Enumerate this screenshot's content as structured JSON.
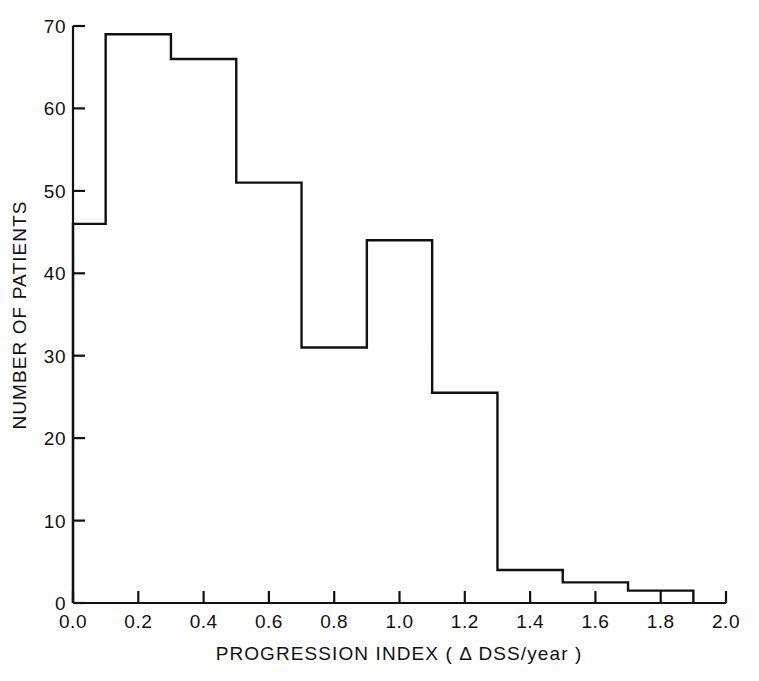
{
  "chart_data": {
    "type": "bar",
    "title": "",
    "subtitle": "",
    "xlabel": "PROGRESSION INDEX ( Δ DSS/year )",
    "ylabel": "NUMBER OF PATIENTS",
    "xlim": [
      0.0,
      2.0
    ],
    "ylim": [
      0,
      70
    ],
    "grid": false,
    "legend": "none",
    "bin_width": 0.2,
    "bin_edges": [
      0.0,
      0.1,
      0.3,
      0.5,
      0.7,
      0.9,
      1.1,
      1.3,
      1.5,
      1.7,
      1.9
    ],
    "categories": [
      "0.0–0.1",
      "0.1–0.3",
      "0.3–0.5",
      "0.5–0.7",
      "0.7–0.9",
      "0.9–1.1",
      "1.1–1.3",
      "1.3–1.5",
      "1.5–1.7",
      "1.7–1.9"
    ],
    "values": [
      46,
      69,
      66,
      51,
      31,
      44,
      25.5,
      4,
      2.5,
      1.5
    ],
    "x_ticks": [
      0.0,
      0.2,
      0.4,
      0.6,
      0.8,
      1.0,
      1.2,
      1.4,
      1.6,
      1.8,
      2.0
    ],
    "x_tick_labels": [
      "0.0",
      "0.2",
      "0.4",
      "0.6",
      "0.8",
      "1.0",
      "1.2",
      "1.4",
      "1.6",
      "1.8",
      "2.0"
    ],
    "y_ticks": [
      0,
      10,
      20,
      30,
      40,
      50,
      60,
      70
    ],
    "y_tick_labels": [
      "0",
      "10",
      "20",
      "30",
      "40",
      "50",
      "60",
      "70"
    ],
    "bar_style": "outline",
    "bar_fill": "#ffffff",
    "bar_stroke": "#111111",
    "axis_color": "#111111",
    "background": "#ffffff"
  },
  "caption": {
    "text": ""
  }
}
